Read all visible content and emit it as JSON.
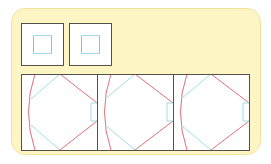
{
  "colors": {
    "card_fill": "#fdf6c4",
    "card_border": "#f3e29a",
    "frame": "#555048",
    "red": "#e0707a",
    "cyan": "#9fdcea",
    "panel_fill": "#ffffff"
  },
  "thumbnails": [
    {
      "x": 21,
      "y": 23,
      "size": 42,
      "inner": 18
    },
    {
      "x": 69,
      "y": 23,
      "size": 42,
      "inner": 18
    }
  ],
  "panels": [
    {
      "x": 21,
      "y": 74,
      "w": 76,
      "h": 76
    },
    {
      "x": 97,
      "y": 74,
      "w": 76,
      "h": 76
    },
    {
      "x": 173,
      "y": 74,
      "w": 76,
      "h": 76
    }
  ]
}
